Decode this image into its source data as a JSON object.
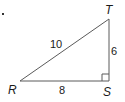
{
  "figure": {
    "type": "right-triangle",
    "vertices": {
      "R": {
        "label": "R"
      },
      "S": {
        "label": "S"
      },
      "T": {
        "label": "T"
      }
    },
    "sides": {
      "RT": {
        "label": "10"
      },
      "ST": {
        "label": "6"
      },
      "RS": {
        "label": "8"
      }
    },
    "right_angle_at": "S",
    "colors": {
      "line": "#5a5a5a",
      "text": "#1a1a1a"
    }
  }
}
